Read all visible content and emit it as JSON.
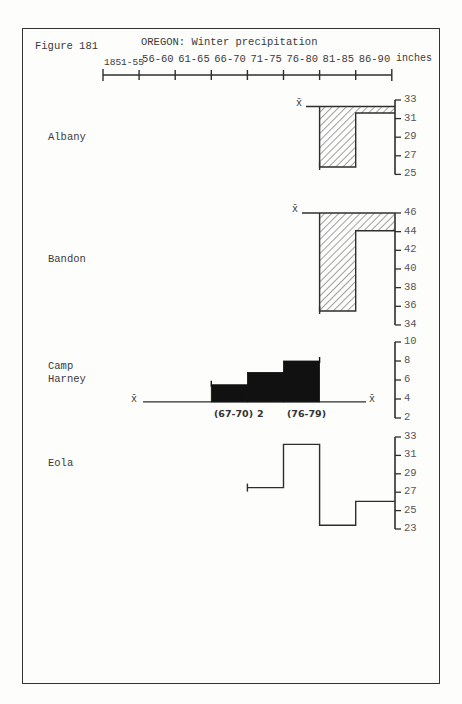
{
  "figure": {
    "label": "Figure 181",
    "title": "OREGON:  Winter precipitation",
    "unit_label": "inches"
  },
  "time_axis": {
    "periods": [
      "1851-55",
      "56-60",
      "61-65",
      "66-70",
      "71-75",
      "76-80",
      "81-85",
      "86-90"
    ]
  },
  "stations": [
    {
      "name": "Albany",
      "name_lines": [
        "Albany"
      ],
      "mean_label": "x̄",
      "ticks": [
        "33",
        "31",
        "29",
        "27",
        "25"
      ]
    },
    {
      "name": "Bandon",
      "name_lines": [
        "Bandon"
      ],
      "mean_label": "x̄",
      "ticks": [
        "46",
        "44",
        "42",
        "40",
        "38",
        "36",
        "34"
      ]
    },
    {
      "name": "Camp Harney",
      "name_lines": [
        "Camp",
        "Harney"
      ],
      "mean_label": "x̄",
      "ticks": [
        "10",
        "8",
        "6",
        "4",
        "2"
      ],
      "annotations": [
        "(67-70)",
        "2",
        "(76-79)"
      ]
    },
    {
      "name": "Eola",
      "name_lines": [
        "Eola"
      ],
      "ticks": [
        "33",
        "31",
        "29",
        "27",
        "25",
        "23"
      ]
    }
  ],
  "chart_data": [
    {
      "type": "bar",
      "title": "Albany",
      "categories": [
        "81-85",
        "86-90"
      ],
      "values": [
        25.8,
        31.6
      ],
      "mean": 32.3,
      "ylabel": "inches",
      "ylim": [
        25,
        33
      ],
      "style": "hatched deviation from mean"
    },
    {
      "type": "bar",
      "title": "Bandon",
      "categories": [
        "81-85",
        "86-90"
      ],
      "values": [
        35.5,
        44.1
      ],
      "mean": 46.0,
      "ylabel": "inches",
      "ylim": [
        34,
        46
      ],
      "style": "hatched deviation from mean"
    },
    {
      "type": "bar",
      "title": "Camp Harney",
      "categories": [
        "66-70",
        "71-75",
        "76-80"
      ],
      "values": [
        5.5,
        6.8,
        8.0
      ],
      "mean": 3.7,
      "ylabel": "inches",
      "ylim": [
        2,
        10
      ],
      "annotations": [
        "(67-70)",
        "2",
        "(76-79)"
      ],
      "style": "solid fill above mean"
    },
    {
      "type": "line",
      "title": "Eola",
      "categories": [
        "71-75",
        "76-80",
        "81-85",
        "86-90"
      ],
      "values": [
        27.5,
        32.2,
        23.4,
        26.0
      ],
      "ylabel": "inches",
      "ylim": [
        23,
        33
      ],
      "style": "step"
    }
  ]
}
